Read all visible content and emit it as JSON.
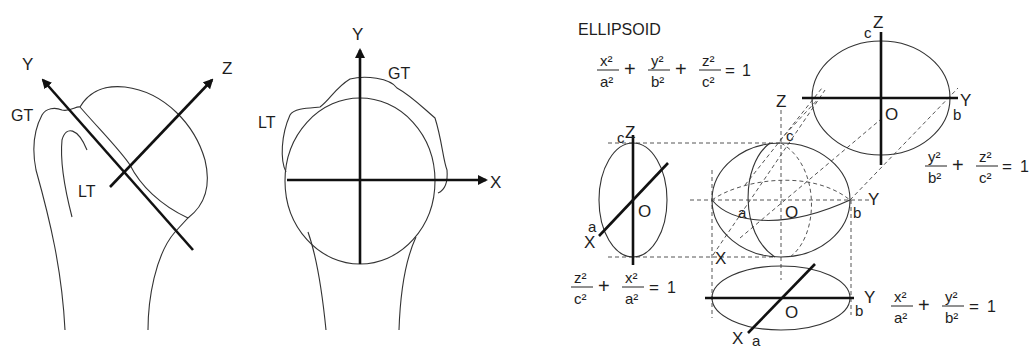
{
  "panel_left": {
    "axis_labels": {
      "y": "Y",
      "z": "Z"
    },
    "landmarks": {
      "gt": "GT",
      "lt": "LT"
    }
  },
  "panel_middle": {
    "axis_labels": {
      "y": "Y",
      "x": "X"
    },
    "landmarks": {
      "gt": "GT",
      "lt": "LT"
    }
  },
  "panel_right": {
    "title": "ELLIPSOID",
    "main_equation": {
      "terms": [
        {
          "num": "x²",
          "den": "a²"
        },
        {
          "num": "y²",
          "den": "b²"
        },
        {
          "num": "z²",
          "den": "c²"
        }
      ],
      "plus": "+",
      "equals": "=",
      "rhs": "1"
    },
    "top_view": {
      "labels": {
        "z_top": "Z",
        "c": "c",
        "y": "Y",
        "b": "b",
        "o": "O",
        "z_left": "Z"
      },
      "equation": {
        "terms": [
          {
            "num": "y²",
            "den": "b²"
          },
          {
            "num": "z²",
            "den": "c²"
          }
        ],
        "plus": "+",
        "equals": "=",
        "rhs": "1"
      }
    },
    "side_view": {
      "labels": {
        "z": "Z",
        "c": "c",
        "x": "X",
        "a": "a",
        "o": "O"
      },
      "equation": {
        "terms": [
          {
            "num": "z²",
            "den": "c²"
          },
          {
            "num": "x²",
            "den": "a²"
          }
        ],
        "plus": "+",
        "equals": "=",
        "rhs": "1"
      }
    },
    "center_view": {
      "labels": {
        "c": "c",
        "a": "a",
        "o": "O",
        "b": "b",
        "y": "Y",
        "x": "X"
      }
    },
    "bottom_view": {
      "labels": {
        "y": "Y",
        "b": "b",
        "o": "O",
        "x": "X",
        "a": "a"
      },
      "equation": {
        "terms": [
          {
            "num": "x²",
            "den": "a²"
          },
          {
            "num": "y²",
            "den": "b²"
          }
        ],
        "plus": "+",
        "equals": "=",
        "rhs": "1"
      }
    }
  }
}
